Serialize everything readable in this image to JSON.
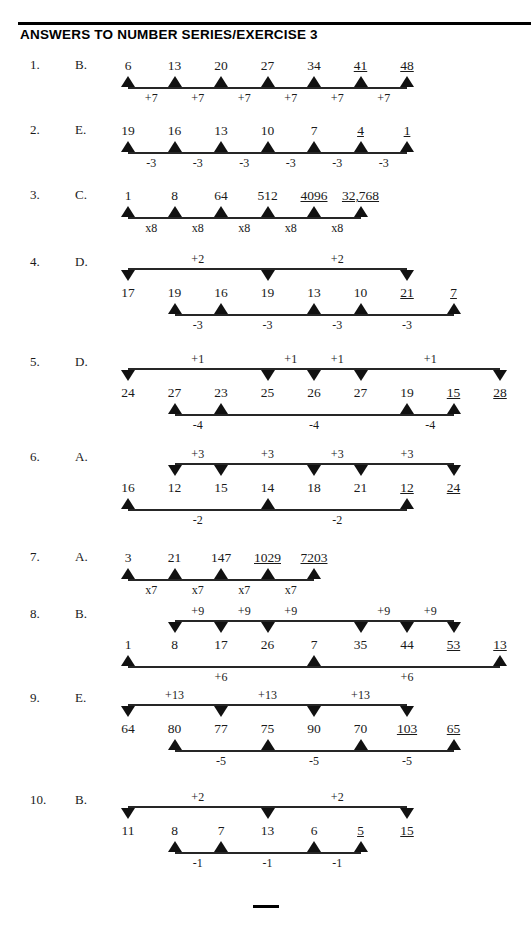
{
  "document": {
    "title": "ANSWERS TO NUMBER SERIES/EXERCISE 3",
    "footer_rule": "—"
  },
  "layout": {
    "col0_x": 128,
    "col_step": 46.5,
    "note": "term columns are evenly spaced across the work area"
  },
  "items": [
    {
      "number": "1.",
      "answer": "B.",
      "terms": [
        {
          "text": "6",
          "col": 0,
          "underline": false
        },
        {
          "text": "13",
          "col": 1,
          "underline": false
        },
        {
          "text": "20",
          "col": 2,
          "underline": false
        },
        {
          "text": "27",
          "col": 3,
          "underline": false
        },
        {
          "text": "34",
          "col": 4,
          "underline": false
        },
        {
          "text": "41",
          "col": 5,
          "underline": true
        },
        {
          "text": "48",
          "col": 6,
          "underline": true
        }
      ],
      "bottom": {
        "arrow_cols": [
          0,
          1,
          2,
          3,
          4,
          5,
          6
        ],
        "deltas": [
          {
            "text": "+7",
            "col": 0.5
          },
          {
            "text": "+7",
            "col": 1.5
          },
          {
            "text": "+7",
            "col": 2.5
          },
          {
            "text": "+7",
            "col": 3.5
          },
          {
            "text": "+7",
            "col": 4.5
          },
          {
            "text": "+7",
            "col": 5.5
          }
        ]
      },
      "top": null
    },
    {
      "number": "2.",
      "answer": "E.",
      "terms": [
        {
          "text": "19",
          "col": 0,
          "underline": false
        },
        {
          "text": "16",
          "col": 1,
          "underline": false
        },
        {
          "text": "13",
          "col": 2,
          "underline": false
        },
        {
          "text": "10",
          "col": 3,
          "underline": false
        },
        {
          "text": "7",
          "col": 4,
          "underline": false
        },
        {
          "text": "4",
          "col": 5,
          "underline": true
        },
        {
          "text": "1",
          "col": 6,
          "underline": true
        }
      ],
      "bottom": {
        "arrow_cols": [
          0,
          1,
          2,
          3,
          4,
          5,
          6
        ],
        "deltas": [
          {
            "text": "-3",
            "col": 0.5
          },
          {
            "text": "-3",
            "col": 1.5
          },
          {
            "text": "-3",
            "col": 2.5
          },
          {
            "text": "-3",
            "col": 3.5
          },
          {
            "text": "-3",
            "col": 4.5
          },
          {
            "text": "-3",
            "col": 5.5
          }
        ]
      },
      "top": null
    },
    {
      "number": "3.",
      "answer": "C.",
      "terms": [
        {
          "text": "1",
          "col": 0,
          "underline": false
        },
        {
          "text": "8",
          "col": 1,
          "underline": false
        },
        {
          "text": "64",
          "col": 2,
          "underline": false
        },
        {
          "text": "512",
          "col": 3,
          "underline": false
        },
        {
          "text": "4096",
          "col": 4,
          "underline": true
        },
        {
          "text": "32,768",
          "col": 5,
          "underline": true
        }
      ],
      "bottom": {
        "arrow_cols": [
          0,
          1,
          2,
          3,
          4,
          5
        ],
        "deltas": [
          {
            "text": "x8",
            "col": 0.5
          },
          {
            "text": "x8",
            "col": 1.5
          },
          {
            "text": "x8",
            "col": 2.5
          },
          {
            "text": "x8",
            "col": 3.5
          },
          {
            "text": "x8",
            "col": 4.5
          }
        ]
      },
      "top": null
    },
    {
      "number": "4.",
      "answer": "D.",
      "terms": [
        {
          "text": "17",
          "col": 0,
          "underline": false
        },
        {
          "text": "19",
          "col": 1,
          "underline": false
        },
        {
          "text": "16",
          "col": 2,
          "underline": false
        },
        {
          "text": "19",
          "col": 3,
          "underline": false
        },
        {
          "text": "13",
          "col": 4,
          "underline": false
        },
        {
          "text": "10",
          "col": 5,
          "underline": false
        },
        {
          "text": "21",
          "col": 6,
          "underline": true
        },
        {
          "text": "7",
          "col": 7,
          "underline": true
        }
      ],
      "top": {
        "arrow_cols": [
          0,
          3,
          6
        ],
        "deltas": [
          {
            "text": "+2",
            "col": 1.5
          },
          {
            "text": "+2",
            "col": 4.5
          }
        ]
      },
      "bottom": {
        "arrow_cols": [
          1,
          2,
          4,
          5,
          7
        ],
        "deltas": [
          {
            "text": "-3",
            "col": 1.5
          },
          {
            "text": "-3",
            "col": 3
          },
          {
            "text": "-3",
            "col": 4.5
          },
          {
            "text": "-3",
            "col": 6
          }
        ]
      }
    },
    {
      "number": "5.",
      "answer": "D.",
      "terms": [
        {
          "text": "24",
          "col": 0,
          "underline": false
        },
        {
          "text": "27",
          "col": 1,
          "underline": false
        },
        {
          "text": "23",
          "col": 2,
          "underline": false
        },
        {
          "text": "25",
          "col": 3,
          "underline": false
        },
        {
          "text": "26",
          "col": 4,
          "underline": false
        },
        {
          "text": "27",
          "col": 5,
          "underline": false
        },
        {
          "text": "19",
          "col": 6,
          "underline": false
        },
        {
          "text": "15",
          "col": 7,
          "underline": true
        },
        {
          "text": "28",
          "col": 8,
          "underline": true
        }
      ],
      "top": {
        "arrow_cols": [
          0,
          3,
          4,
          5,
          8
        ],
        "deltas": [
          {
            "text": "+1",
            "col": 1.5
          },
          {
            "text": "+1",
            "col": 3.5
          },
          {
            "text": "+1",
            "col": 4.5
          },
          {
            "text": "+1",
            "col": 6.5
          }
        ]
      },
      "bottom": {
        "arrow_cols": [
          1,
          2,
          6,
          7
        ],
        "deltas": [
          {
            "text": "-4",
            "col": 1.5
          },
          {
            "text": "-4",
            "col": 4
          },
          {
            "text": "-4",
            "col": 6.5
          }
        ]
      }
    },
    {
      "number": "6.",
      "answer": "A.",
      "terms": [
        {
          "text": "16",
          "col": 0,
          "underline": false
        },
        {
          "text": "12",
          "col": 1,
          "underline": false
        },
        {
          "text": "15",
          "col": 2,
          "underline": false
        },
        {
          "text": "14",
          "col": 3,
          "underline": false
        },
        {
          "text": "18",
          "col": 4,
          "underline": false
        },
        {
          "text": "21",
          "col": 5,
          "underline": false
        },
        {
          "text": "12",
          "col": 6,
          "underline": true
        },
        {
          "text": "24",
          "col": 7,
          "underline": true
        }
      ],
      "top": {
        "arrow_cols": [
          1,
          2,
          4,
          5,
          7
        ],
        "deltas": [
          {
            "text": "+3",
            "col": 1.5
          },
          {
            "text": "+3",
            "col": 3
          },
          {
            "text": "+3",
            "col": 4.5
          },
          {
            "text": "+3",
            "col": 6
          }
        ]
      },
      "bottom": {
        "arrow_cols": [
          0,
          3,
          6
        ],
        "deltas": [
          {
            "text": "-2",
            "col": 1.5
          },
          {
            "text": "-2",
            "col": 4.5
          }
        ]
      }
    },
    {
      "number": "7.",
      "answer": "A.",
      "terms": [
        {
          "text": "3",
          "col": 0,
          "underline": false
        },
        {
          "text": "21",
          "col": 1,
          "underline": false
        },
        {
          "text": "147",
          "col": 2,
          "underline": false
        },
        {
          "text": "1029",
          "col": 3,
          "underline": true
        },
        {
          "text": "7203",
          "col": 4,
          "underline": true
        }
      ],
      "top": null,
      "bottom": {
        "arrow_cols": [
          0,
          1,
          2,
          3,
          4
        ],
        "deltas": [
          {
            "text": "x7",
            "col": 0.5
          },
          {
            "text": "x7",
            "col": 1.5
          },
          {
            "text": "x7",
            "col": 2.5
          },
          {
            "text": "x7",
            "col": 3.5
          }
        ]
      }
    },
    {
      "number": "8.",
      "answer": "B.",
      "terms": [
        {
          "text": "1",
          "col": 0,
          "underline": false
        },
        {
          "text": "8",
          "col": 1,
          "underline": false
        },
        {
          "text": "17",
          "col": 2,
          "underline": false
        },
        {
          "text": "26",
          "col": 3,
          "underline": false
        },
        {
          "text": "7",
          "col": 4,
          "underline": false
        },
        {
          "text": "35",
          "col": 5,
          "underline": false
        },
        {
          "text": "44",
          "col": 6,
          "underline": false
        },
        {
          "text": "53",
          "col": 7,
          "underline": true
        },
        {
          "text": "13",
          "col": 8,
          "underline": true
        }
      ],
      "top": {
        "arrow_cols": [
          1,
          2,
          3,
          5,
          6,
          7
        ],
        "deltas": [
          {
            "text": "+9",
            "col": 1.5
          },
          {
            "text": "+9",
            "col": 2.5
          },
          {
            "text": "+9",
            "col": 3.5
          },
          {
            "text": "+9",
            "col": 5.5
          },
          {
            "text": "+9",
            "col": 6.5
          }
        ]
      },
      "bottom": {
        "arrow_cols": [
          0,
          4,
          8
        ],
        "deltas": [
          {
            "text": "+6",
            "col": 2
          },
          {
            "text": "+6",
            "col": 6
          }
        ]
      }
    },
    {
      "number": "9.",
      "answer": "E.",
      "terms": [
        {
          "text": "64",
          "col": 0,
          "underline": false
        },
        {
          "text": "80",
          "col": 1,
          "underline": false
        },
        {
          "text": "77",
          "col": 2,
          "underline": false
        },
        {
          "text": "75",
          "col": 3,
          "underline": false
        },
        {
          "text": "90",
          "col": 4,
          "underline": false
        },
        {
          "text": "70",
          "col": 5,
          "underline": false
        },
        {
          "text": "103",
          "col": 6,
          "underline": true
        },
        {
          "text": "65",
          "col": 7,
          "underline": true
        }
      ],
      "top": {
        "arrow_cols": [
          0,
          2,
          4,
          6
        ],
        "deltas": [
          {
            "text": "+13",
            "col": 1
          },
          {
            "text": "+13",
            "col": 3
          },
          {
            "text": "+13",
            "col": 5
          }
        ]
      },
      "bottom": {
        "arrow_cols": [
          1,
          3,
          5,
          7
        ],
        "deltas": [
          {
            "text": "-5",
            "col": 2
          },
          {
            "text": "-5",
            "col": 4
          },
          {
            "text": "-5",
            "col": 6
          }
        ]
      }
    },
    {
      "number": "10.",
      "answer": "B.",
      "terms": [
        {
          "text": "11",
          "col": 0,
          "underline": false
        },
        {
          "text": "8",
          "col": 1,
          "underline": false
        },
        {
          "text": "7",
          "col": 2,
          "underline": false
        },
        {
          "text": "13",
          "col": 3,
          "underline": false
        },
        {
          "text": "6",
          "col": 4,
          "underline": false
        },
        {
          "text": "5",
          "col": 5,
          "underline": true
        },
        {
          "text": "15",
          "col": 6,
          "underline": true
        }
      ],
      "top": {
        "arrow_cols": [
          0,
          3,
          6
        ],
        "deltas": [
          {
            "text": "+2",
            "col": 1.5
          },
          {
            "text": "+2",
            "col": 4.5
          }
        ]
      },
      "bottom": {
        "arrow_cols": [
          1,
          2,
          4,
          5
        ],
        "deltas": [
          {
            "text": "-1",
            "col": 1.5
          },
          {
            "text": "-1",
            "col": 3
          },
          {
            "text": "-1",
            "col": 4.5
          }
        ]
      }
    }
  ]
}
